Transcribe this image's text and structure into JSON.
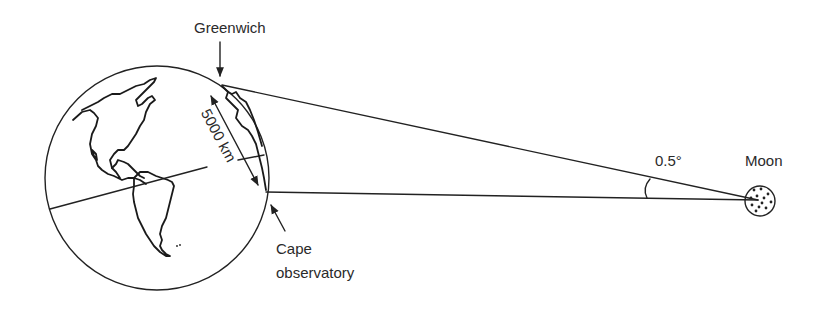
{
  "labels": {
    "greenwich": "Greenwich",
    "distance": "5000 km",
    "cape_line1": "Cape",
    "cape_line2": "observatory",
    "angle": "0.5°",
    "moon": "Moon"
  },
  "values": {
    "baseline_km": 5000,
    "parallax_angle_deg": 0.5
  },
  "colors": {
    "ink": "#222222",
    "background": "#ffffff"
  }
}
